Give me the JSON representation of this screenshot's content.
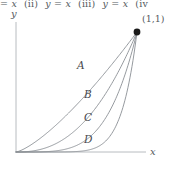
{
  "header": {
    "clipped_line": {
      "seg1": "= x",
      "item2_num": "(ii)",
      "item2_eq": "y = x",
      "item3_num": "(iii)",
      "item3_eq": "y = x",
      "item4_num": "(iv"
    }
  },
  "figure": {
    "axes": {
      "y_label": "y",
      "x_label": "x",
      "axis_color": "#b8bcc0"
    },
    "point": {
      "label": "(1,1)",
      "marker_color": "#1a1a1a"
    },
    "curve_color": "#8a8f94",
    "curves": [
      {
        "id": "A",
        "label": "A",
        "exponent": 1.35,
        "label_x": 77,
        "label_y": 60
      },
      {
        "id": "B",
        "label": "B",
        "exponent": 2.4,
        "label_x": 84,
        "label_y": 89
      },
      {
        "id": "C",
        "label": "C",
        "exponent": 4.2,
        "label_x": 84,
        "label_y": 112
      },
      {
        "id": "D",
        "label": "D",
        "exponent": 8.0,
        "label_x": 84,
        "label_y": 134
      }
    ]
  },
  "chart_data": {
    "type": "line",
    "title": "",
    "xlabel": "x",
    "ylabel": "y",
    "xlim": [
      0,
      1.13
    ],
    "ylim": [
      0,
      1.0
    ],
    "grid": false,
    "legend": "inline-curve-labels",
    "annotations": [
      {
        "text": "(1,1)",
        "x": 1.0,
        "y": 1.0
      }
    ],
    "series": [
      {
        "name": "A",
        "formula": "y = x^1.35",
        "x": [
          0,
          0.1,
          0.2,
          0.3,
          0.4,
          0.5,
          0.6,
          0.7,
          0.8,
          0.9,
          1.0
        ],
        "values": [
          0,
          0.045,
          0.114,
          0.196,
          0.289,
          0.393,
          0.504,
          0.624,
          0.751,
          0.886,
          1.0
        ]
      },
      {
        "name": "B",
        "formula": "y = x^2.4",
        "x": [
          0,
          0.1,
          0.2,
          0.3,
          0.4,
          0.5,
          0.6,
          0.7,
          0.8,
          0.9,
          1.0
        ],
        "values": [
          0,
          0.004,
          0.021,
          0.055,
          0.11,
          0.189,
          0.296,
          0.432,
          0.6,
          0.77,
          1.0
        ]
      },
      {
        "name": "C",
        "formula": "y = x^4.2",
        "x": [
          0,
          0.1,
          0.2,
          0.3,
          0.4,
          0.5,
          0.6,
          0.7,
          0.8,
          0.9,
          1.0
        ],
        "values": [
          0,
          6e-05,
          0.0011,
          0.0071,
          0.0276,
          0.0544,
          0.113,
          0.212,
          0.362,
          0.643,
          1.0
        ]
      },
      {
        "name": "D",
        "formula": "y = x^8",
        "x": [
          0,
          0.1,
          0.2,
          0.3,
          0.4,
          0.5,
          0.6,
          0.7,
          0.8,
          0.9,
          1.0
        ],
        "values": [
          0,
          1e-07,
          2.6e-06,
          6.6e-05,
          0.00066,
          0.0039,
          0.0168,
          0.0576,
          0.1678,
          0.4305,
          1.0
        ]
      }
    ]
  }
}
